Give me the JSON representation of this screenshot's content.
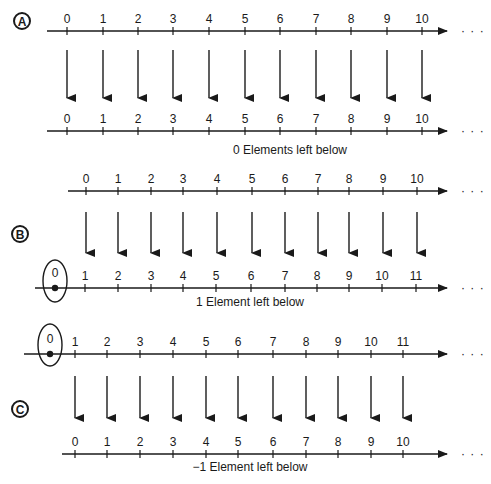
{
  "colors": {
    "ink": "#1a1a1a",
    "background": "#ffffff"
  },
  "panels": [
    {
      "id": "A",
      "label": "A",
      "label_pos": [
        22,
        21
      ],
      "caption": "0 Elements left below",
      "caption_pos": [
        290,
        154
      ],
      "top_line": {
        "y": 31,
        "x_start": 47,
        "x_end": 447,
        "ticks": [
          {
            "x": 67,
            "label": "0"
          },
          {
            "x": 103,
            "label": "1"
          },
          {
            "x": 138,
            "label": "2"
          },
          {
            "x": 173,
            "label": "3"
          },
          {
            "x": 209,
            "label": "4"
          },
          {
            "x": 245,
            "label": "5"
          },
          {
            "x": 280,
            "label": "6"
          },
          {
            "x": 316,
            "label": "7"
          },
          {
            "x": 351,
            "label": "8"
          },
          {
            "x": 387,
            "label": "9"
          },
          {
            "x": 422,
            "label": "10"
          }
        ],
        "circled": null
      },
      "arrows": {
        "y_start": 50,
        "y_end": 98,
        "xs": [
          67,
          103,
          138,
          173,
          209,
          245,
          280,
          316,
          351,
          387,
          422
        ]
      },
      "bottom_line": {
        "y": 131,
        "x_start": 47,
        "x_end": 447,
        "ticks": [
          {
            "x": 67,
            "label": "0"
          },
          {
            "x": 103,
            "label": "1"
          },
          {
            "x": 138,
            "label": "2"
          },
          {
            "x": 173,
            "label": "3"
          },
          {
            "x": 209,
            "label": "4"
          },
          {
            "x": 245,
            "label": "5"
          },
          {
            "x": 280,
            "label": "6"
          },
          {
            "x": 316,
            "label": "7"
          },
          {
            "x": 351,
            "label": "8"
          },
          {
            "x": 387,
            "label": "9"
          },
          {
            "x": 422,
            "label": "10"
          }
        ],
        "circled": null
      }
    },
    {
      "id": "B",
      "label": "B",
      "label_pos": [
        20,
        234
      ],
      "caption": "1 Element left below",
      "caption_pos": [
        250,
        306
      ],
      "top_line": {
        "y": 191,
        "x_start": 68,
        "x_end": 447,
        "ticks": [
          {
            "x": 86,
            "label": "0"
          },
          {
            "x": 118,
            "label": "1"
          },
          {
            "x": 151,
            "label": "2"
          },
          {
            "x": 183,
            "label": "3"
          },
          {
            "x": 217,
            "label": "4"
          },
          {
            "x": 252,
            "label": "5"
          },
          {
            "x": 285,
            "label": "6"
          },
          {
            "x": 318,
            "label": "7"
          },
          {
            "x": 349,
            "label": "8"
          },
          {
            "x": 383,
            "label": "9"
          },
          {
            "x": 417,
            "label": "10"
          }
        ],
        "circled": null
      },
      "arrows": {
        "y_start": 212,
        "y_end": 253,
        "xs": [
          86,
          118,
          151,
          183,
          217,
          252,
          285,
          318,
          349,
          383,
          417
        ]
      },
      "bottom_line": {
        "y": 288,
        "x_start": 35,
        "x_end": 447,
        "ticks": [
          {
            "x": 85,
            "label": "1"
          },
          {
            "x": 118,
            "label": "2"
          },
          {
            "x": 151,
            "label": "3"
          },
          {
            "x": 183,
            "label": "4"
          },
          {
            "x": 216,
            "label": "5"
          },
          {
            "x": 251,
            "label": "6"
          },
          {
            "x": 285,
            "label": "7"
          },
          {
            "x": 317,
            "label": "8"
          },
          {
            "x": 349,
            "label": "9"
          },
          {
            "x": 382,
            "label": "10"
          },
          {
            "x": 416,
            "label": "11"
          }
        ],
        "circled": {
          "x": 55,
          "label": "0",
          "cy": 289,
          "rx": 12,
          "ry": 21
        }
      }
    },
    {
      "id": "C",
      "label": "C",
      "label_pos": [
        20,
        409
      ],
      "caption": "−1 Element left below",
      "caption_pos": [
        250,
        471
      ],
      "top_line": {
        "y": 354,
        "x_start": 24,
        "x_end": 447,
        "ticks": [
          {
            "x": 75,
            "label": "1"
          },
          {
            "x": 107,
            "label": "2"
          },
          {
            "x": 140,
            "label": "3"
          },
          {
            "x": 173,
            "label": "4"
          },
          {
            "x": 206,
            "label": "5"
          },
          {
            "x": 238,
            "label": "6"
          },
          {
            "x": 273,
            "label": "7"
          },
          {
            "x": 306,
            "label": "8"
          },
          {
            "x": 338,
            "label": "9"
          },
          {
            "x": 371,
            "label": "10"
          },
          {
            "x": 403,
            "label": "11"
          }
        ],
        "circled": {
          "x": 50,
          "label": "0",
          "cy": 353,
          "rx": 12,
          "ry": 21
        }
      },
      "arrows": {
        "y_start": 376,
        "y_end": 418,
        "xs": [
          75,
          107,
          140,
          173,
          206,
          238,
          273,
          306,
          338,
          371,
          403
        ]
      },
      "bottom_line": {
        "y": 454,
        "x_start": 62,
        "x_end": 447,
        "ticks": [
          {
            "x": 75,
            "label": "0"
          },
          {
            "x": 107,
            "label": "1"
          },
          {
            "x": 140,
            "label": "2"
          },
          {
            "x": 173,
            "label": "3"
          },
          {
            "x": 206,
            "label": "4"
          },
          {
            "x": 238,
            "label": "5"
          },
          {
            "x": 273,
            "label": "6"
          },
          {
            "x": 306,
            "label": "7"
          },
          {
            "x": 338,
            "label": "8"
          },
          {
            "x": 371,
            "label": "9"
          },
          {
            "x": 403,
            "label": "10"
          }
        ],
        "circled": null
      }
    }
  ],
  "continuation": "· · ·"
}
